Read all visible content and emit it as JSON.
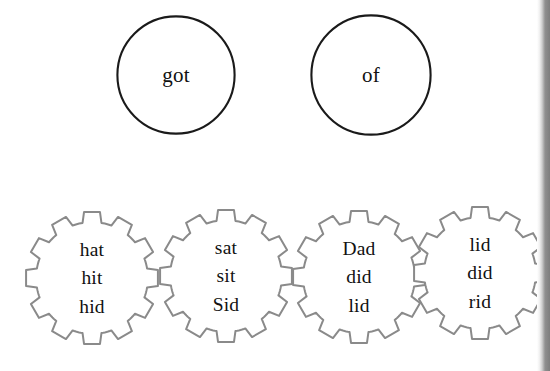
{
  "worksheet": {
    "title": "Word family shapes worksheet",
    "circle_outline_color": "#1a1a1a",
    "gear_outline_color": "#8a8a8a",
    "text_color": "#111111",
    "background_color": "#ffffff",
    "edge_band_color": "#7d7d7d"
  },
  "circles": [
    {
      "id": "circle-got",
      "shape": "circle",
      "words": [
        "got"
      ],
      "x": 116,
      "y": 15,
      "size": 120
    },
    {
      "id": "circle-of",
      "shape": "circle",
      "words": [
        "of"
      ],
      "x": 310,
      "y": 14,
      "size": 122
    }
  ],
  "gears": [
    {
      "id": "gear-hat",
      "shape": "gear",
      "teeth": 12,
      "words": [
        "hat",
        "hit",
        "hid"
      ],
      "x": 24,
      "y": 210,
      "size": 136
    },
    {
      "id": "gear-sat",
      "shape": "gear",
      "teeth": 12,
      "words": [
        "sat",
        "sit",
        "Sid"
      ],
      "x": 158,
      "y": 208,
      "size": 136
    },
    {
      "id": "gear-dad",
      "shape": "gear",
      "teeth": 12,
      "words": [
        "Dad",
        "did",
        "lid"
      ],
      "x": 291,
      "y": 209,
      "size": 136
    },
    {
      "id": "gear-lid",
      "shape": "gear",
      "teeth": 12,
      "words": [
        "lid",
        "did",
        "rid"
      ],
      "x": 412,
      "y": 205,
      "size": 136
    }
  ]
}
